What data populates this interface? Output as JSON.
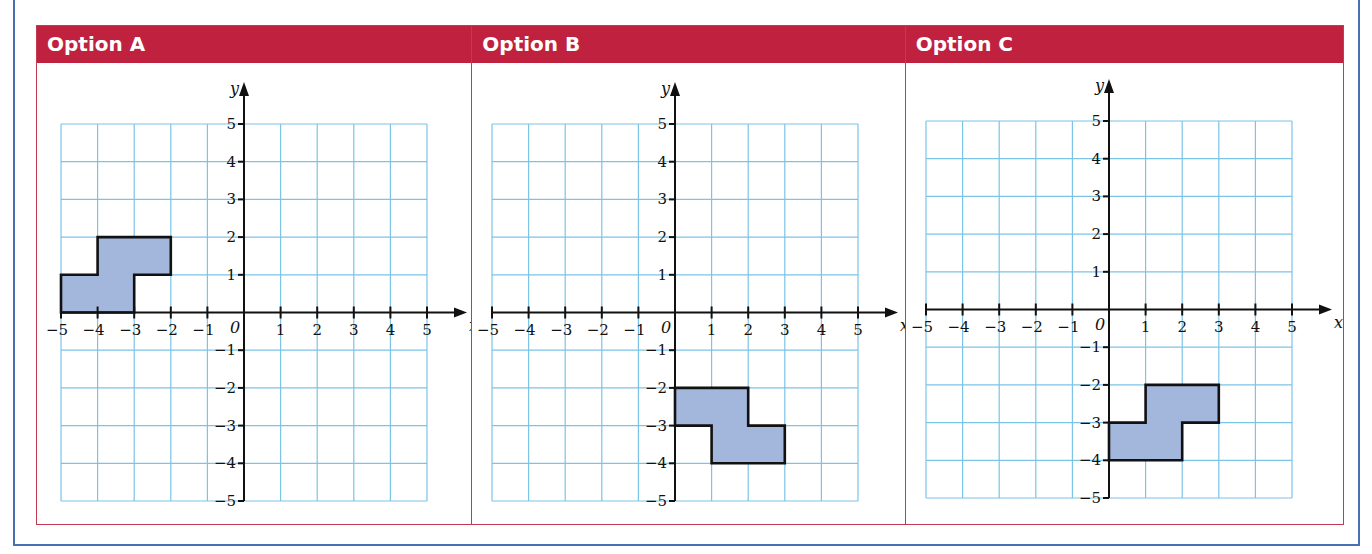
{
  "page": {
    "cut_off_text": "…",
    "colors": {
      "header_bg": "#c0213f",
      "table_border": "#c23a52",
      "outer_frame": "#4a6fb5",
      "grid_line": "#7cc3e8",
      "shape_fill": "#a3b7dd",
      "shape_stroke": "#111111"
    }
  },
  "options": [
    {
      "label": "Option A",
      "shape": [
        [
          -5,
          0
        ],
        [
          -3,
          0
        ],
        [
          -3,
          1
        ],
        [
          -2,
          1
        ],
        [
          -2,
          2
        ],
        [
          -4,
          2
        ],
        [
          -4,
          1
        ],
        [
          -5,
          1
        ]
      ]
    },
    {
      "label": "Option B",
      "shape": [
        [
          0,
          -2
        ],
        [
          2,
          -2
        ],
        [
          2,
          -3
        ],
        [
          3,
          -3
        ],
        [
          3,
          -4
        ],
        [
          1,
          -4
        ],
        [
          1,
          -3
        ],
        [
          0,
          -3
        ]
      ]
    },
    {
      "label": "Option C",
      "shape": [
        [
          0,
          -4
        ],
        [
          2,
          -4
        ],
        [
          2,
          -3
        ],
        [
          3,
          -3
        ],
        [
          3,
          -2
        ],
        [
          1,
          -2
        ],
        [
          1,
          -3
        ],
        [
          0,
          -3
        ]
      ]
    }
  ],
  "axes": {
    "x_label": "x",
    "y_label": "y",
    "origin_label": "0",
    "x_ticks": [
      "−5",
      "−4",
      "−3",
      "−2",
      "−1",
      "1",
      "2",
      "3",
      "4",
      "5"
    ],
    "y_ticks": [
      "5",
      "4",
      "3",
      "2",
      "1",
      "−1",
      "−2",
      "−3",
      "−4",
      "−5"
    ],
    "range": [
      -5,
      5
    ]
  },
  "chart_data": [
    {
      "type": "scatter",
      "title": "Option A",
      "xlabel": "x",
      "ylabel": "y",
      "xlim": [
        -5,
        5
      ],
      "ylim": [
        -5,
        5
      ],
      "grid": true,
      "polygon": [
        [
          -5,
          0
        ],
        [
          -3,
          0
        ],
        [
          -3,
          1
        ],
        [
          -2,
          1
        ],
        [
          -2,
          2
        ],
        [
          -4,
          2
        ],
        [
          -4,
          1
        ],
        [
          -5,
          1
        ]
      ]
    },
    {
      "type": "scatter",
      "title": "Option B",
      "xlabel": "x",
      "ylabel": "y",
      "xlim": [
        -5,
        5
      ],
      "ylim": [
        -5,
        5
      ],
      "grid": true,
      "polygon": [
        [
          0,
          -2
        ],
        [
          2,
          -2
        ],
        [
          2,
          -3
        ],
        [
          3,
          -3
        ],
        [
          3,
          -4
        ],
        [
          1,
          -4
        ],
        [
          1,
          -3
        ],
        [
          0,
          -3
        ]
      ]
    },
    {
      "type": "scatter",
      "title": "Option C",
      "xlabel": "x",
      "ylabel": "y",
      "xlim": [
        -5,
        5
      ],
      "ylim": [
        -5,
        5
      ],
      "grid": true,
      "polygon": [
        [
          0,
          -4
        ],
        [
          2,
          -4
        ],
        [
          2,
          -3
        ],
        [
          3,
          -3
        ],
        [
          3,
          -2
        ],
        [
          1,
          -2
        ],
        [
          1,
          -3
        ],
        [
          0,
          -3
        ]
      ]
    }
  ]
}
